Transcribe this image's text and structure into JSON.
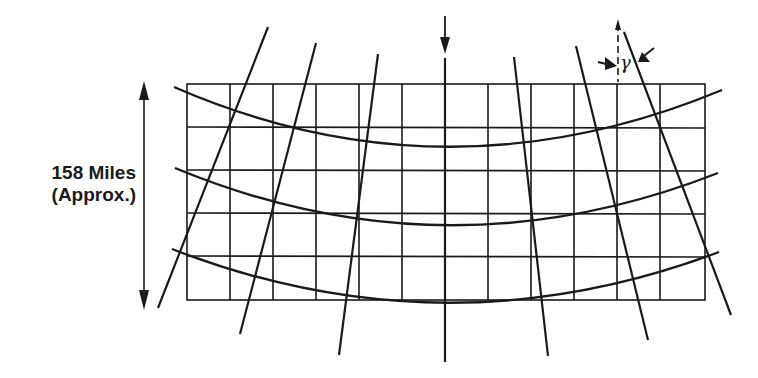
{
  "diagram": {
    "dimension_label_line1": "158 Miles",
    "dimension_label_line2": "(Approx.)",
    "angle_symbol": "γ",
    "colors": {
      "ink": "#1a1a1a",
      "background": "#ffffff"
    },
    "grid": {
      "columns": 12,
      "rows": 5
    },
    "curved_lines": 3,
    "converging_lines": 8
  }
}
